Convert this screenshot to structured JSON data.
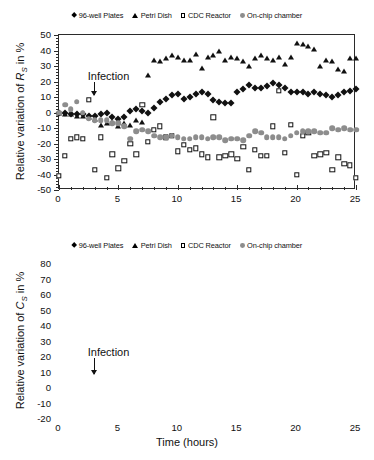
{
  "figure": {
    "panels": [
      "top",
      "bottom"
    ]
  },
  "legend": {
    "items": [
      {
        "label": "96-well Plates",
        "marker": "filled-diamond-icon",
        "color": "#111111"
      },
      {
        "label": "Petri Dish",
        "marker": "filled-triangle-icon",
        "color": "#111111"
      },
      {
        "label": "CDC Reactor",
        "marker": "open-square-icon",
        "color": "#111111"
      },
      {
        "label": "On-chip chamber",
        "marker": "gray-circle-icon",
        "color": "#8d8d8d"
      }
    ]
  },
  "annotation": {
    "label": "Infection",
    "at_hours": 2
  },
  "chart_data": [
    {
      "type": "scatter",
      "id": "top-panel-rs",
      "title": "",
      "xlabel": "",
      "ylabel": "Relative variation of R_S in %",
      "ylabel_parts": {
        "prefix": "Relative variation of ",
        "symbol": "R",
        "subscript": "S",
        "suffix": " in %"
      },
      "xlim": [
        0,
        25
      ],
      "ylim": [
        -50,
        50
      ],
      "xticks": [
        0,
        5,
        10,
        15,
        20,
        25
      ],
      "yticks": [
        -50,
        -40,
        -30,
        -20,
        -10,
        0,
        10,
        20,
        30,
        40,
        50
      ],
      "x_minor_step": 1,
      "y_minor_step": 2,
      "grid": false,
      "legend_position": "above",
      "annotations": [
        {
          "text": "Infection",
          "x": 2,
          "y": 22,
          "arrow_to_y": 8
        }
      ],
      "x": [
        0.0,
        0.5,
        1.0,
        1.5,
        2.0,
        2.5,
        3.0,
        3.5,
        4.0,
        4.5,
        5.0,
        5.5,
        6.0,
        6.5,
        7.0,
        7.5,
        8.0,
        8.5,
        9.0,
        9.5,
        10.0,
        10.5,
        11.0,
        11.5,
        12.0,
        12.5,
        13.0,
        13.5,
        14.0,
        14.5,
        15.0,
        15.5,
        16.0,
        16.5,
        17.0,
        17.5,
        18.0,
        18.5,
        19.0,
        19.5,
        20.0,
        20.5,
        21.0,
        21.5,
        22.0,
        22.5,
        23.0,
        23.5,
        24.0,
        24.5,
        25.0
      ],
      "series": [
        {
          "name": "96-well Plates",
          "marker": "filled-diamond",
          "color": "#111111",
          "values": [
            0,
            0,
            -1,
            -1,
            -1,
            -2,
            -2,
            -1,
            0,
            -3,
            -4,
            -3,
            1,
            2,
            1,
            0,
            3,
            7,
            9,
            11,
            12,
            9,
            10,
            12,
            13,
            12,
            8,
            7,
            6,
            6,
            13,
            15,
            18,
            16,
            16,
            17,
            19,
            18,
            16,
            13,
            13,
            13,
            12,
            13,
            12,
            11,
            10,
            11,
            13,
            14,
            15
          ]
        },
        {
          "name": "Petri Dish",
          "marker": "filled-triangle",
          "color": "#111111",
          "values": [
            0,
            -1,
            -1,
            -2,
            -2,
            -3,
            -4,
            -8,
            -7,
            -6,
            -9,
            -7,
            -8,
            -5,
            -6,
            24,
            34,
            33,
            35,
            37,
            36,
            34,
            34,
            38,
            29,
            36,
            37,
            40,
            34,
            36,
            35,
            33,
            30,
            35,
            37,
            35,
            34,
            36,
            31,
            36,
            45,
            44,
            43,
            41,
            30,
            34,
            33,
            28,
            27,
            35,
            35
          ]
        },
        {
          "name": "CDC Reactor",
          "marker": "open-square",
          "color": "#111111",
          "values": [
            -41,
            -28,
            -17,
            -16,
            -17,
            8,
            -37,
            -16,
            -42,
            -27,
            -36,
            -31,
            -20,
            -27,
            5,
            -19,
            -11,
            -9,
            -16,
            -15,
            -25,
            -21,
            -24,
            -23,
            -27,
            -29,
            -3,
            -29,
            -28,
            -27,
            -30,
            -22,
            -37,
            -24,
            -28,
            -28,
            -9,
            14,
            -26,
            -8,
            -40,
            -15,
            -13,
            -28,
            -27,
            -26,
            -37,
            -29,
            -33,
            -34,
            -42
          ]
        },
        {
          "name": "On-chip chamber",
          "marker": "gray-circle",
          "color": "#8d8d8d",
          "values": [
            0,
            5,
            2,
            7,
            0,
            -4,
            -5,
            -5,
            -5,
            -7,
            -7,
            -9,
            -17,
            -12,
            -11,
            -12,
            -15,
            -16,
            -16,
            -15,
            -16,
            -17,
            -17,
            -16,
            -16,
            -17,
            -16,
            -16,
            -18,
            -17,
            -17,
            -18,
            -15,
            -12,
            -13,
            -16,
            -16,
            -16,
            -17,
            -15,
            -13,
            -12,
            -12,
            -12,
            -13,
            -13,
            -10,
            -11,
            -10,
            -11,
            -11
          ]
        }
      ]
    },
    {
      "type": "scatter",
      "id": "bottom-panel-cs",
      "title": "",
      "xlabel": "Time (hours)",
      "ylabel": "Relative variation of C_S in %",
      "ylabel_parts": {
        "prefix": "Relative variation of ",
        "symbol": "C",
        "subscript": "S",
        "suffix": " in %"
      },
      "xlim": [
        0,
        25
      ],
      "ylim": [
        -20,
        80
      ],
      "xticks": [
        0,
        5,
        10,
        15,
        20,
        25
      ],
      "yticks": [
        -20,
        -10,
        0,
        10,
        20,
        30,
        40,
        50,
        60,
        70,
        80
      ],
      "x_minor_step": 1,
      "y_minor_step": 2,
      "grid": false,
      "legend_position": "above",
      "annotations": [
        {
          "text": "Infection",
          "x": 2,
          "y": 22,
          "arrow_to_y": 6
        }
      ],
      "x": [
        0.0,
        0.5,
        1.0,
        1.5,
        2.0,
        2.5,
        3.0,
        3.5,
        4.0,
        4.5,
        5.0,
        5.5,
        6.0,
        6.5,
        7.0,
        7.5,
        8.0,
        8.5,
        9.0,
        9.5,
        10.0,
        10.5,
        11.0,
        11.5,
        12.0,
        12.5,
        13.0,
        13.5,
        14.0,
        14.5,
        15.0,
        15.5,
        16.0,
        16.5,
        17.0,
        17.5,
        18.0,
        18.5,
        19.0,
        19.5,
        20.0,
        20.5,
        21.0,
        21.5,
        22.0,
        22.5,
        23.0,
        23.5,
        24.0,
        24.5,
        25.0
      ],
      "series": [
        {
          "name": "96-well Plates",
          "marker": "filled-diamond",
          "color": "#111111",
          "values": [
            -1,
            0,
            0,
            1,
            1,
            1,
            1,
            1,
            0,
            1,
            1,
            1,
            1,
            2,
            3,
            4,
            5,
            5,
            5,
            6,
            6,
            6,
            6,
            6,
            6,
            6,
            6,
            6,
            6,
            6,
            6,
            6,
            6,
            6,
            6,
            5,
            5,
            5,
            5,
            4,
            4,
            4,
            4,
            4,
            3,
            3,
            3,
            3,
            3,
            3,
            2
          ]
        },
        {
          "name": "Petri Dish",
          "marker": "filled-triangle",
          "color": "#111111",
          "values": [
            -1,
            0,
            0,
            1,
            1,
            1,
            1,
            1,
            0,
            1,
            1,
            1,
            2,
            3,
            5,
            6,
            7,
            8,
            9,
            10,
            10,
            11,
            11,
            11,
            11,
            11,
            11,
            11,
            11,
            11,
            11,
            11,
            11,
            11,
            11,
            11,
            11,
            11,
            11,
            11,
            11,
            11,
            11,
            11,
            11,
            11,
            11,
            11,
            11,
            11,
            11
          ]
        },
        {
          "name": "CDC Reactor",
          "marker": "open-square",
          "color": "#111111",
          "values": [
            -1,
            -1,
            -2,
            -2,
            -2,
            -3,
            -4,
            -4,
            -5,
            -3,
            -2,
            -2,
            -1,
            1,
            4,
            10,
            24,
            36,
            44,
            45,
            50,
            51,
            53,
            55,
            55,
            54,
            51,
            60,
            54,
            50,
            47,
            46,
            45,
            49,
            43,
            44,
            41,
            32,
            39,
            39,
            38,
            39,
            40,
            38,
            39,
            38,
            38,
            39,
            39,
            38,
            37
          ]
        },
        {
          "name": "On-chip chamber",
          "marker": "gray-circle",
          "color": "#8d8d8d",
          "values": [
            -1,
            -1,
            -1,
            -1,
            -1,
            -2,
            -2,
            -3,
            -3,
            -3,
            -3,
            -3,
            -3,
            -2,
            -1,
            0,
            1,
            3,
            4,
            8,
            11,
            17,
            23,
            29,
            34,
            39,
            43,
            45,
            47,
            49,
            50,
            51,
            51,
            50,
            51,
            52,
            53,
            53,
            53,
            53,
            53,
            53,
            53,
            53,
            52,
            52,
            51,
            51,
            50,
            50,
            49
          ]
        }
      ]
    }
  ]
}
